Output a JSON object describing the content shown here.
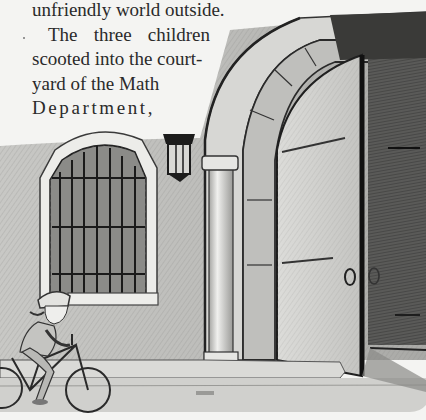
{
  "text": {
    "lines": [
      "unfriendly world outside.",
      "The three children",
      "scooted into the court-",
      "yard of the Math",
      "Department,"
    ],
    "line2_words": [
      "The",
      "three",
      "children"
    ]
  },
  "illustration": {
    "description": "Pencil drawing of a child on a bicycle riding past a stucco wall with a barred arched window, a wall lantern, and a large open arched wooden door",
    "elements": [
      "wall",
      "barred-window",
      "wall-lantern",
      "pillar",
      "arched-doorway",
      "open-door",
      "door-ring-handle",
      "child-cyclist",
      "bicycle",
      "sidewalk"
    ]
  },
  "colors": {
    "paper": "#f4f4f2",
    "ink": "#2a2a2a",
    "wall": "#c9c9c6",
    "shadow": "#3a3a3a"
  }
}
